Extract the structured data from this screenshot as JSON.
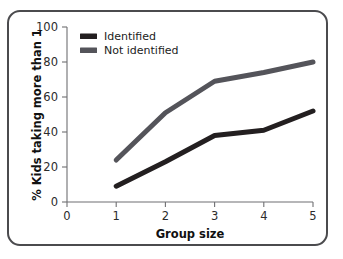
{
  "chart_data": {
    "type": "line",
    "title": "",
    "xlabel": "Group size",
    "ylabel": "% Kids taking more than 1",
    "x": [
      1,
      2,
      3,
      4,
      5
    ],
    "xlim": [
      0,
      5
    ],
    "ylim": [
      0,
      100
    ],
    "xticks": [
      "0",
      "1",
      "2",
      "3",
      "4",
      "5"
    ],
    "yticks": [
      "0",
      "20",
      "40",
      "60",
      "80",
      "100"
    ],
    "grid": false,
    "legend_position": "top-left",
    "series": [
      {
        "name": "Identified",
        "color": "#231f20",
        "values": [
          9,
          23,
          38,
          41,
          52
        ]
      },
      {
        "name": "Not identified",
        "color": "#54545a",
        "values": [
          24,
          51,
          69,
          74,
          80
        ]
      }
    ]
  },
  "axes": {
    "x_title": "Group size",
    "y_title": "% Kids taking more than 1",
    "x_tick_labels": [
      "0",
      "1",
      "2",
      "3",
      "4",
      "5"
    ],
    "y_tick_labels": [
      "0",
      "20",
      "40",
      "60",
      "80",
      "100"
    ]
  },
  "legend": {
    "entries": [
      {
        "label": "Identified",
        "swatch_color": "#231f20"
      },
      {
        "label": "Not identified",
        "swatch_color": "#54545a"
      }
    ]
  },
  "colors": {
    "frame_border": "#4b4b4e",
    "axis": "#6f6f72",
    "background": "#ffffff",
    "identified": "#231f20",
    "not_identified": "#54545a"
  }
}
